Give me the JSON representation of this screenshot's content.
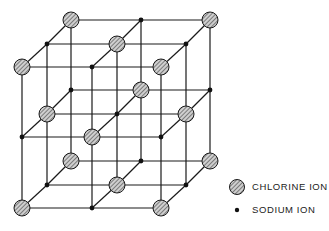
{
  "diagram": {
    "type": "3x3x3 cubic lattice",
    "colors": {
      "line": "#1a1a1a",
      "chlorine_fill": "#c9c9c9",
      "hatch": "#333333",
      "sodium": "#111111"
    },
    "front_x": [
      22,
      92,
      161
    ],
    "front_y": [
      67,
      137,
      208
    ],
    "depth_offset": [
      [
        0,
        0
      ],
      [
        25,
        -23
      ],
      [
        49,
        -47
      ]
    ],
    "chlorine_radius": 8,
    "sodium_radius": 2.4
  },
  "legend": {
    "items": [
      {
        "symbol": "chlorine-sphere",
        "label": "CHLORINE ION"
      },
      {
        "symbol": "sodium-dot",
        "label": "SODIUM ION"
      }
    ]
  }
}
